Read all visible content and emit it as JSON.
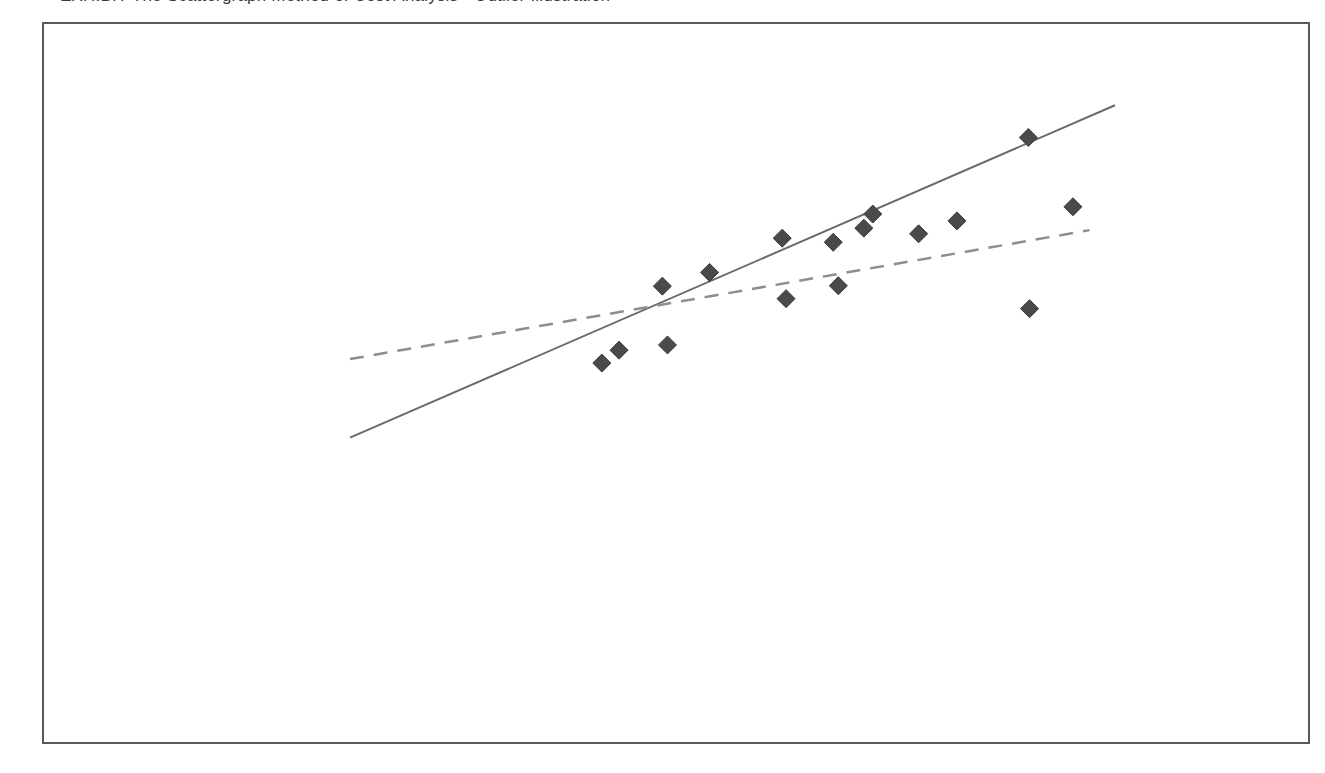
{
  "caption": {
    "text": "EXHIBIT  The Scattergraph Method of Cost Analysis - Outlier Illustration"
  },
  "chart_data": {
    "type": "scatter",
    "title": "",
    "xlabel": "Machine-Hours",
    "ylabel": "Overhead Cost",
    "xlim": [
      0,
      6000
    ],
    "ylim": [
      0,
      140000
    ],
    "grid": false,
    "legend_position": "none",
    "x_ticks": [
      0,
      1000,
      2000,
      3000,
      4000,
      5000,
      6000
    ],
    "x_tick_labels": [
      "0",
      "1,000",
      "2,000",
      "3,000",
      "4,000",
      "5,000",
      "6,000"
    ],
    "y_ticks": [
      0,
      20000,
      40000,
      60000,
      80000,
      100000,
      120000,
      140000
    ],
    "y_tick_labels": [
      "0",
      "$20,000",
      "$40,000",
      "$60,000",
      "$80,000",
      "$100,000",
      "$120,000",
      "$140,000"
    ],
    "marker": "diamond",
    "marker_color": "#4a4a4a",
    "points": [
      {
        "x": 1975,
        "y": 67000
      },
      {
        "x": 2110,
        "y": 70200
      },
      {
        "x": 2450,
        "y": 86100
      },
      {
        "x": 2490,
        "y": 71500
      },
      {
        "x": 2820,
        "y": 89500
      },
      {
        "x": 3390,
        "y": 98000
      },
      {
        "x": 3420,
        "y": 83000
      },
      {
        "x": 3790,
        "y": 97000
      },
      {
        "x": 3830,
        "y": 86200
      },
      {
        "x": 4030,
        "y": 100500
      },
      {
        "x": 4100,
        "y": 104000
      },
      {
        "x": 4460,
        "y": 99100
      },
      {
        "x": 4760,
        "y": 102300
      },
      {
        "x": 5320,
        "y": 123000
      },
      {
        "x": 5330,
        "y": 80500
      },
      {
        "x": 5670,
        "y": 105800
      }
    ],
    "series": [
      {
        "name": "True regression line",
        "type": "line",
        "style": "solid",
        "color": "#6b6b6b",
        "x": [
          0,
          6000
        ],
        "y": [
          48500,
          131000
        ]
      },
      {
        "name": "Computed regression line",
        "type": "line",
        "style": "dashed",
        "color": "#8e8e8e",
        "x": [
          0,
          5800
        ],
        "y": [
          68000,
          100000
        ]
      }
    ],
    "annotations": [
      {
        "label": "Computed regression line",
        "label_x": 1180,
        "label_y": 93500,
        "target_x": 1850,
        "target_y": 79000
      },
      {
        "label": "True regression line",
        "label_x": 1500,
        "label_y": 45500,
        "target_x": 1190,
        "target_y": 59500
      },
      {
        "label": "“Outlier”",
        "label_x": 4270,
        "label_y": 66500,
        "target_x": 5200,
        "target_y": 79500
      }
    ]
  }
}
